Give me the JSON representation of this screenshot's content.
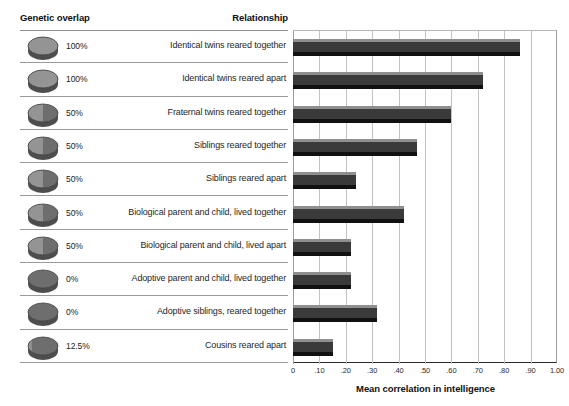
{
  "table": {
    "header_genetic": "Genetic overlap",
    "header_relationship": "Relationship"
  },
  "axis": {
    "title": "Mean correlation in intelligence",
    "tick_labels": [
      "0",
      ".10",
      ".20",
      ".30",
      ".40",
      ".50",
      ".60",
      ".70",
      ".80",
      ".90",
      "1.00"
    ],
    "tick_values": [
      0,
      0.1,
      0.2,
      0.3,
      0.4,
      0.5,
      0.6,
      0.7,
      0.8,
      0.9,
      1.0
    ]
  },
  "colors": {
    "bar_top": "#8f8f8f",
    "bar_body": "#3a3a3a",
    "bar_bottom": "#111111",
    "gridline": "#c2c2c2",
    "rule": "#9a9a9a",
    "disc_fill": "#6e6e6e",
    "disc_shade": "#8c8c8c"
  },
  "chart_data": {
    "type": "bar",
    "orientation": "horizontal",
    "title": "",
    "xlabel": "Mean correlation in intelligence",
    "ylabel": "",
    "xlim": [
      0,
      1.0
    ],
    "xticks": [
      0,
      0.1,
      0.2,
      0.3,
      0.4,
      0.5,
      0.6,
      0.7,
      0.8,
      0.9,
      1.0
    ],
    "grid": "vertical",
    "legend": "none",
    "categories": [
      "Identical twins reared together",
      "Identical twins reared apart",
      "Fraternal twins reared together",
      "Siblings reared together",
      "Siblings reared apart",
      "Biological parent and child, lived together",
      "Biological parent and child, lived apart",
      "Adoptive parent and child, lived together",
      "Adoptive siblings, reared together",
      "Cousins reared apart"
    ],
    "values": [
      0.86,
      0.72,
      0.6,
      0.47,
      0.24,
      0.42,
      0.22,
      0.22,
      0.32,
      0.15
    ],
    "genetic_overlap": [
      "100%",
      "100%",
      "50%",
      "50%",
      "50%",
      "50%",
      "50%",
      "0%",
      "0%",
      "12.5%"
    ],
    "genetic_overlap_fraction": [
      1.0,
      1.0,
      0.5,
      0.5,
      0.5,
      0.5,
      0.5,
      0.0,
      0.0,
      0.125
    ]
  },
  "rows": [
    {
      "pct": "100%",
      "frac": 1.0,
      "label": "Identical twins reared together",
      "value": 0.86
    },
    {
      "pct": "100%",
      "frac": 1.0,
      "label": "Identical twins reared apart",
      "value": 0.72
    },
    {
      "pct": "50%",
      "frac": 0.5,
      "label": "Fraternal twins reared together",
      "value": 0.6
    },
    {
      "pct": "50%",
      "frac": 0.5,
      "label": "Siblings reared together",
      "value": 0.47
    },
    {
      "pct": "50%",
      "frac": 0.5,
      "label": "Siblings reared apart",
      "value": 0.24
    },
    {
      "pct": "50%",
      "frac": 0.5,
      "label": "Biological parent and child, lived together",
      "value": 0.42
    },
    {
      "pct": "50%",
      "frac": 0.5,
      "label": "Biological parent and child, lived apart",
      "value": 0.22
    },
    {
      "pct": "0%",
      "frac": 0.0,
      "label": "Adoptive parent and child, lived together",
      "value": 0.22
    },
    {
      "pct": "0%",
      "frac": 0.0,
      "label": "Adoptive siblings, reared together",
      "value": 0.32
    },
    {
      "pct": "12.5%",
      "frac": 0.125,
      "label": "Cousins reared apart",
      "value": 0.15
    }
  ]
}
